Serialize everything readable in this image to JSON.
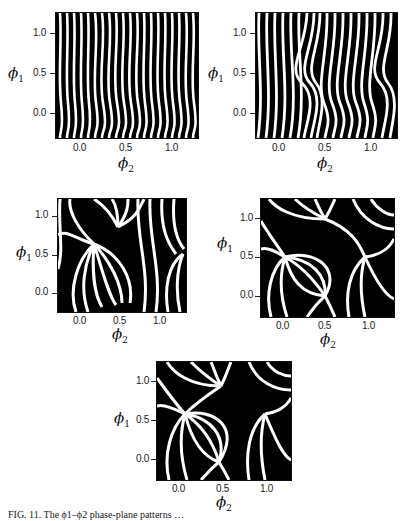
{
  "figure": {
    "caption": "FIG. 11. The ϕ1–ϕ2 phase-plane patterns …",
    "panels": [
      {
        "id": "p1",
        "frame": {
          "left": 55,
          "top": 12,
          "width": 142,
          "height": 125
        },
        "pattern": "vertical-wavy",
        "ylabel": "ϕ",
        "ylabel_sub": "1",
        "xlabel": "ϕ",
        "xlabel_sub": "2",
        "yticks": [
          "1.0",
          "0.5",
          "0.0"
        ],
        "xticks": [
          "0.0",
          "0.5",
          "1.0"
        ]
      },
      {
        "id": "p2",
        "frame": {
          "left": 255,
          "top": 12,
          "width": 141,
          "height": 125
        },
        "pattern": "vertical-kinked",
        "ylabel": "ϕ",
        "ylabel_sub": "1",
        "xlabel": "ϕ",
        "xlabel_sub": "2",
        "yticks": [
          "1.0",
          "0.5",
          "0.0"
        ],
        "xticks": [
          "0.0",
          "0.5",
          "1.0"
        ]
      },
      {
        "id": "p3",
        "frame": {
          "left": 57,
          "top": 198,
          "width": 128,
          "height": 113
        },
        "pattern": "vortex-weak",
        "ylabel": "ϕ",
        "ylabel_sub": "1",
        "xlabel": "ϕ",
        "xlabel_sub": "2",
        "yticks": [
          "1.0",
          "0.5",
          "0.0"
        ],
        "xticks": [
          "0.0",
          "0.5",
          "1.0"
        ]
      },
      {
        "id": "p4",
        "frame": {
          "left": 260,
          "top": 198,
          "width": 133,
          "height": 118
        },
        "pattern": "vortex-strong",
        "ylabel": "ϕ",
        "ylabel_sub": "1",
        "xlabel": "ϕ",
        "xlabel_sub": "2",
        "yticks": [
          "1.0",
          "0.5",
          "0.0"
        ],
        "xticks": [
          "0.0",
          "0.5",
          "1.0"
        ]
      },
      {
        "id": "p5",
        "frame": {
          "left": 156,
          "top": 361,
          "width": 134,
          "height": 118
        },
        "pattern": "vortex-strong",
        "ylabel": "ϕ",
        "ylabel_sub": "1",
        "xlabel": "ϕ",
        "xlabel_sub": "2",
        "yticks": [
          "1.0",
          "0.5",
          "0.0"
        ],
        "xticks": [
          "0.0",
          "0.5",
          "1.0"
        ]
      }
    ]
  },
  "colors": {
    "ink": "#000000",
    "paper": "#ffffff"
  }
}
